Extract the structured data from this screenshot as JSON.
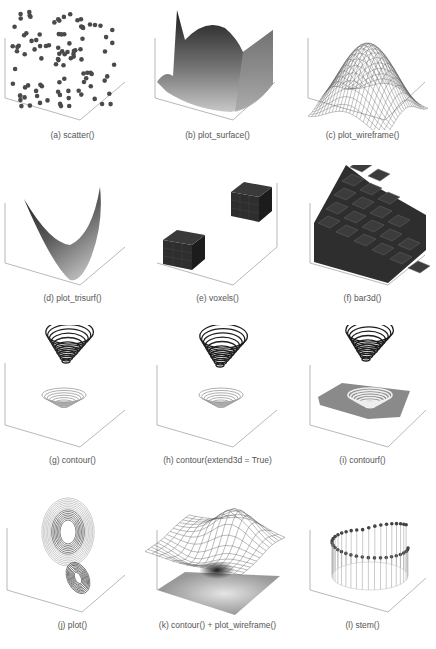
{
  "figure": {
    "panels": [
      {
        "id": "a",
        "caption": "(a) scatter()"
      },
      {
        "id": "b",
        "caption": "(b) plot_surface()"
      },
      {
        "id": "c",
        "caption": "(c) plot_wireframe()"
      },
      {
        "id": "d",
        "caption": "(d) plot_trisurf()"
      },
      {
        "id": "e",
        "caption": "(e) voxels()"
      },
      {
        "id": "f",
        "caption": "(f) bar3d()"
      },
      {
        "id": "g",
        "caption": "(g) contour()"
      },
      {
        "id": "h",
        "caption": "(h) contour(extend3d = True)"
      },
      {
        "id": "i",
        "caption": "(i) contourf()"
      },
      {
        "id": "j",
        "caption": "(j) plot()"
      },
      {
        "id": "k",
        "caption": "(k) contour() + plot_wireframe()"
      },
      {
        "id": "l",
        "caption": "(l) stem()"
      }
    ]
  },
  "colors": {
    "axis": "#777777",
    "dark": "#2e2e2e",
    "mid": "#808080",
    "light": "#cfcfcf",
    "caption": "#555555"
  },
  "chart_data": [
    {
      "type": "scatter",
      "title": "(a) scatter()",
      "projection": "3d",
      "series": [
        {
          "name": "points",
          "count": 100,
          "marker": "o",
          "color": "#444444"
        }
      ]
    },
    {
      "type": "surface",
      "title": "(b) plot_surface()",
      "projection": "3d",
      "colormap": "grayscale"
    },
    {
      "type": "wireframe",
      "title": "(c) plot_wireframe()",
      "projection": "3d"
    },
    {
      "type": "trisurf",
      "title": "(d) plot_trisurf()",
      "projection": "3d",
      "shape": "saddle"
    },
    {
      "type": "voxels",
      "title": "(e) voxels()",
      "projection": "3d",
      "cubes": 2
    },
    {
      "type": "bar3d",
      "title": "(f) bar3d()",
      "projection": "3d",
      "layout": "staircase"
    },
    {
      "type": "contour",
      "title": "(g) contour()",
      "projection": "3d"
    },
    {
      "type": "contour",
      "title": "(h) contour(extend3d = True)",
      "projection": "3d",
      "extend3d": true
    },
    {
      "type": "contourf",
      "title": "(i) contourf()",
      "projection": "3d"
    },
    {
      "type": "line",
      "title": "(j) plot()",
      "projection": "3d",
      "shape": "lorenz-attractor"
    },
    {
      "type": "contour+wireframe",
      "title": "(k) contour() + plot_wireframe()",
      "projection": "3d"
    },
    {
      "type": "stem",
      "title": "(l) stem()",
      "projection": "3d",
      "shape": "helix-stems"
    }
  ]
}
